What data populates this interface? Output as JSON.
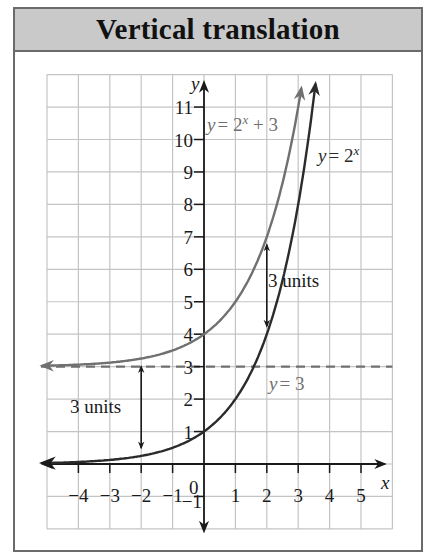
{
  "title": "Vertical translation",
  "chart_data": {
    "type": "line",
    "title": "Vertical translation",
    "xlabel": "x",
    "ylabel": "y",
    "xlim": [
      -5,
      6
    ],
    "ylim": [
      -2,
      12
    ],
    "grid": true,
    "x_tick_labels": [
      "−4",
      "−3",
      "−2",
      "−1",
      "0",
      "1",
      "2",
      "3",
      "4",
      "5"
    ],
    "y_tick_labels": [
      "−1",
      "1",
      "2",
      "3",
      "4",
      "5",
      "6",
      "7",
      "8",
      "9",
      "10",
      "11"
    ],
    "series": [
      {
        "name": "y = 2^x",
        "color": "#2b2b2b",
        "formula": "2^x",
        "x": [
          -5,
          -4,
          -3,
          -2,
          -1,
          0,
          1,
          2,
          3,
          3.5
        ],
        "y": [
          0.03,
          0.06,
          0.13,
          0.25,
          0.5,
          1,
          2,
          4,
          8,
          11.3
        ]
      },
      {
        "name": "y = 2^x + 3",
        "color": "#6e6e6e",
        "formula": "2^x + 3",
        "x": [
          -5,
          -4,
          -3,
          -2,
          -1,
          0,
          1,
          2,
          3,
          3.1
        ],
        "y": [
          3.03,
          3.06,
          3.13,
          3.25,
          3.5,
          4,
          5,
          7,
          11,
          11.6
        ]
      },
      {
        "name": "y = 3",
        "color": "#6e6e6e",
        "style": "dashed",
        "asymptote": true,
        "x": [
          -5,
          6
        ],
        "y": [
          3,
          3
        ]
      }
    ],
    "annotations": [
      {
        "text": "3 units",
        "at_x": -2,
        "from_y": 0.25,
        "to_y": 3.25
      },
      {
        "text": "3 units",
        "at_x": 2,
        "from_y": 4,
        "to_y": 7
      }
    ]
  },
  "labels": {
    "y_axis": "y",
    "x_axis": "x",
    "origin": "0",
    "curve_shifted_lhs": "y",
    "curve_shifted_rhs": "= 2",
    "curve_shifted_exp": "x",
    "curve_shifted_tail": " + 3",
    "curve_base_lhs": "y",
    "curve_base_rhs": "= 2",
    "curve_base_exp": "x",
    "asymptote_lhs": "y",
    "asymptote_rhs": "= 3",
    "annotation_left": "3 units",
    "annotation_right": "3 units"
  },
  "ticks": {
    "x": [
      {
        "v": -4,
        "t": "−4"
      },
      {
        "v": -3,
        "t": "−3"
      },
      {
        "v": -2,
        "t": "−2"
      },
      {
        "v": -1,
        "t": "−1"
      },
      {
        "v": 1,
        "t": "1"
      },
      {
        "v": 2,
        "t": "2"
      },
      {
        "v": 3,
        "t": "3"
      },
      {
        "v": 4,
        "t": "4"
      },
      {
        "v": 5,
        "t": "5"
      }
    ],
    "y": [
      {
        "v": -1,
        "t": "−1"
      },
      {
        "v": 1,
        "t": "1"
      },
      {
        "v": 2,
        "t": "2"
      },
      {
        "v": 3,
        "t": "3"
      },
      {
        "v": 4,
        "t": "4"
      },
      {
        "v": 5,
        "t": "5"
      },
      {
        "v": 6,
        "t": "6"
      },
      {
        "v": 7,
        "t": "7"
      },
      {
        "v": 8,
        "t": "8"
      },
      {
        "v": 9,
        "t": "9"
      },
      {
        "v": 10,
        "t": "10"
      },
      {
        "v": 11,
        "t": "11"
      }
    ]
  },
  "colors": {
    "grid": "#c4c4c4",
    "axis": "#1a1a1a",
    "base_curve": "#2b2b2b",
    "shifted_curve": "#707070",
    "asymptote": "#707070",
    "title_band": "#c9c9c9"
  }
}
